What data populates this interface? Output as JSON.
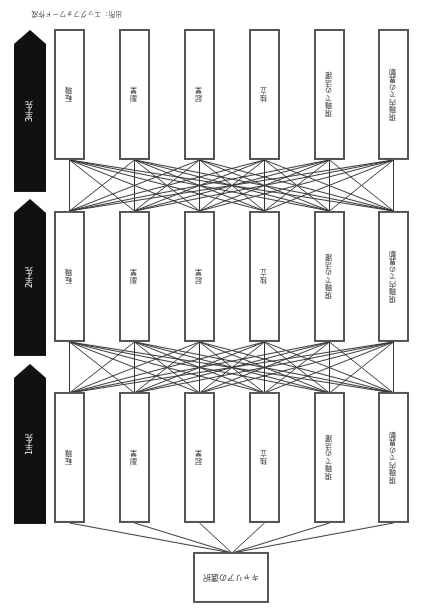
{
  "start": {
    "label": "キャリアの選択"
  },
  "options": [
    "現職内での異動",
    "現職での活躍",
    "独立",
    "起業",
    "副業",
    "転職"
  ],
  "levels": [
    {
      "label": "1手先"
    },
    {
      "label": "2手先"
    },
    {
      "label": "3手先"
    }
  ],
  "caption": "出所：エッグフォワード作成",
  "colors": {
    "box_border": "#555555",
    "arrow_fill": "#111111",
    "line": "#333333"
  }
}
